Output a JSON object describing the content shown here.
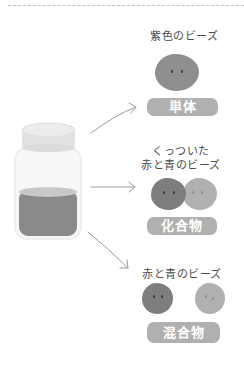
{
  "diagram": {
    "source": {
      "name": "jar",
      "colors": {
        "lid": "#e6e6e6",
        "glass": "#f7f7f7",
        "liquid": "#8a8a8a",
        "liquid_top": "#c8c8c8"
      }
    },
    "branches": [
      {
        "caption_lines": [
          "紫色のビーズ"
        ],
        "beads": [
          {
            "color": "#8e8e8e"
          }
        ],
        "label": "単体"
      },
      {
        "caption_lines": [
          "くっついた",
          "赤と青のビーズ"
        ],
        "beads": [
          {
            "color": "#7e7e7e"
          },
          {
            "color": "#b0b0b0"
          }
        ],
        "label": "化合物"
      },
      {
        "caption_lines": [
          "赤と青のビーズ"
        ],
        "beads": [
          {
            "color": "#7e7e7e"
          },
          {
            "color": "#b0b0b0"
          }
        ],
        "label": "混合物"
      }
    ],
    "label_color": "#b0b0b0",
    "arrow_color": "#9a9a9a"
  }
}
